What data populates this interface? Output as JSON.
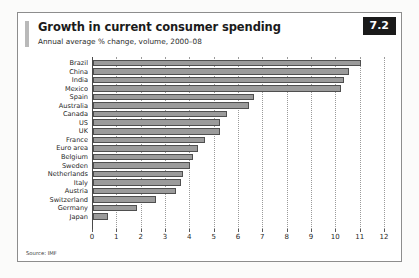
{
  "card": {
    "badge": "7.2",
    "title": "Growth in current consumer spending",
    "subtitle": "Annual average % change, volume, 2000–08",
    "source": "Source: IMF"
  },
  "chart_data": {
    "type": "bar",
    "orientation": "horizontal",
    "title": "Growth in current consumer spending",
    "subtitle": "Annual average % change, volume, 2000–08",
    "xlabel": "",
    "ylabel": "",
    "xlim": [
      0,
      12
    ],
    "xticks": [
      0,
      1,
      2,
      3,
      4,
      5,
      6,
      7,
      8,
      9,
      10,
      11,
      12
    ],
    "xtick_labels": [
      "0",
      "1",
      "2",
      "3",
      "4",
      "5",
      "6",
      "7",
      "8",
      "9",
      "10",
      "11",
      "12"
    ],
    "grid": true,
    "grid_axis": "x",
    "grid_style": "dotted",
    "legend": false,
    "source": "Source: IMF",
    "bar_fill": "#9b9b9b",
    "bar_stroke": "#4f4f4f",
    "categories": [
      "Brazil",
      "China",
      "India",
      "Mexico",
      "Spain",
      "Australia",
      "Canada",
      "US",
      "UK",
      "France",
      "Euro area",
      "Belgium",
      "Sweden",
      "Netherlands",
      "Italy",
      "Austria",
      "Switzerland",
      "Germany",
      "Japan"
    ],
    "values": [
      11.0,
      10.5,
      10.3,
      10.2,
      6.6,
      6.4,
      5.5,
      5.2,
      5.2,
      4.6,
      4.3,
      4.1,
      4.0,
      3.7,
      3.6,
      3.4,
      2.6,
      1.8,
      0.6
    ]
  }
}
